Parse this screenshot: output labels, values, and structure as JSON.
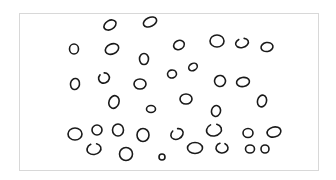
{
  "figure": {
    "frame": {
      "x": 19,
      "y": 13,
      "width": 300,
      "height": 158,
      "border_color": "#d8d8d8"
    },
    "stroke_color": "#1a1a1a",
    "circle_count": 37,
    "circles": [
      {
        "cx": 110,
        "cy": 25,
        "rx": 6.5,
        "ry": 4.5,
        "rot": -30
      },
      {
        "cx": 150,
        "cy": 22,
        "rx": 7,
        "ry": 4.5,
        "rot": -25
      },
      {
        "cx": 74,
        "cy": 49,
        "rx": 4.5,
        "ry": 5,
        "rot": 0
      },
      {
        "cx": 112,
        "cy": 49,
        "rx": 7,
        "ry": 5,
        "rot": -25
      },
      {
        "cx": 144,
        "cy": 59,
        "rx": 4.5,
        "ry": 5.5,
        "rot": 0
      },
      {
        "cx": 179,
        "cy": 45,
        "rx": 5.5,
        "ry": 4.5,
        "rot": -25
      },
      {
        "cx": 217,
        "cy": 41,
        "rx": 7,
        "ry": 6,
        "rot": 0
      },
      {
        "cx": 242,
        "cy": 43,
        "rx": 6.5,
        "ry": 4.5,
        "rot": -15,
        "open": true
      },
      {
        "cx": 267,
        "cy": 47,
        "rx": 6,
        "ry": 4.5,
        "rot": -10
      },
      {
        "cx": 75,
        "cy": 84,
        "rx": 4.5,
        "ry": 5.5,
        "rot": 10
      },
      {
        "cx": 104,
        "cy": 78,
        "rx": 5.5,
        "ry": 5,
        "rot": -30,
        "open": true
      },
      {
        "cx": 140,
        "cy": 84,
        "rx": 6,
        "ry": 5,
        "rot": 0
      },
      {
        "cx": 172,
        "cy": 74,
        "rx": 4.5,
        "ry": 4,
        "rot": -15
      },
      {
        "cx": 193,
        "cy": 67,
        "rx": 4.5,
        "ry": 3.5,
        "rot": -30
      },
      {
        "cx": 220,
        "cy": 81,
        "rx": 5.5,
        "ry": 5.5,
        "rot": 10
      },
      {
        "cx": 243,
        "cy": 82,
        "rx": 6.5,
        "ry": 4.5,
        "rot": -10
      },
      {
        "cx": 114,
        "cy": 102,
        "rx": 5,
        "ry": 6.5,
        "rot": 20
      },
      {
        "cx": 151,
        "cy": 109,
        "rx": 4.5,
        "ry": 3.5,
        "rot": 0
      },
      {
        "cx": 186,
        "cy": 99,
        "rx": 6,
        "ry": 5,
        "rot": 0
      },
      {
        "cx": 216,
        "cy": 111,
        "rx": 4.5,
        "ry": 5.5,
        "rot": 15
      },
      {
        "cx": 262,
        "cy": 101,
        "rx": 4.5,
        "ry": 6,
        "rot": 15
      },
      {
        "cx": 75,
        "cy": 134,
        "rx": 7,
        "ry": 6,
        "rot": 0
      },
      {
        "cx": 97,
        "cy": 130,
        "rx": 5,
        "ry": 5,
        "rot": 0
      },
      {
        "cx": 118,
        "cy": 130,
        "rx": 5.5,
        "ry": 6,
        "rot": 0
      },
      {
        "cx": 143,
        "cy": 135,
        "rx": 6,
        "ry": 6.5,
        "rot": 0
      },
      {
        "cx": 177,
        "cy": 134,
        "rx": 6.5,
        "ry": 5,
        "rot": -30,
        "open": true
      },
      {
        "cx": 214,
        "cy": 130,
        "rx": 7.5,
        "ry": 6,
        "rot": -10,
        "open": true
      },
      {
        "cx": 248,
        "cy": 133,
        "rx": 5,
        "ry": 4.5,
        "rot": 0
      },
      {
        "cx": 274,
        "cy": 132,
        "rx": 7,
        "ry": 5,
        "rot": -15
      },
      {
        "cx": 94,
        "cy": 149,
        "rx": 7,
        "ry": 5.5,
        "rot": -10,
        "open": true
      },
      {
        "cx": 126,
        "cy": 154,
        "rx": 6.5,
        "ry": 6.5,
        "rot": 0
      },
      {
        "cx": 162,
        "cy": 157,
        "rx": 3,
        "ry": 3,
        "rot": 0
      },
      {
        "cx": 195,
        "cy": 148,
        "rx": 7.5,
        "ry": 5.5,
        "rot": 0
      },
      {
        "cx": 222,
        "cy": 148,
        "rx": 6,
        "ry": 5,
        "rot": 0,
        "open": true
      },
      {
        "cx": 250,
        "cy": 149,
        "rx": 4.5,
        "ry": 4,
        "rot": 0
      },
      {
        "cx": 265,
        "cy": 149,
        "rx": 4,
        "ry": 4,
        "rot": 0
      }
    ]
  }
}
